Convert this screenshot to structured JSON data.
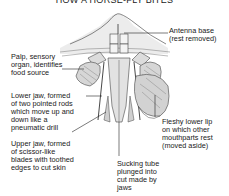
{
  "title": "HOW A HORSE-FLY BITES",
  "labels": {
    "antenna": "Antenna base\n(rest removed)",
    "palp": "Palp, sensory\norgan, identifies\nfood source",
    "lower_jaw": "Lower jaw, formed\nof two pointed rods\nwhich move up and\ndown like a\npneumatic drill",
    "upper_jaw": "Upper jaw, formed\nof scissor-like\nblades with toothed\nedges to cut skin",
    "sucking_tube": "Sucking tube\nplunged into\ncut made by\njaws",
    "lower_lip": "Fleshy lower lip\non which other\nmouthparts rest\n(moved aside)"
  },
  "colors": {
    "head_fill": "#ebebeb",
    "line": "#444444",
    "pad_fill": "#d9d9d9"
  }
}
